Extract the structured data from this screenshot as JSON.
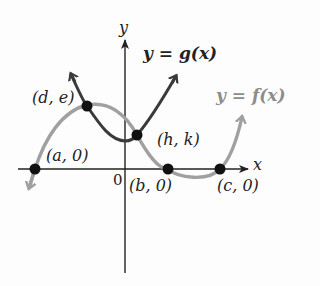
{
  "figure": {
    "x_axis_label": "x",
    "y_axis_label": "y",
    "origin_label": "0",
    "curve_g_label": "y = g(x)",
    "curve_f_label": "y = f(x)",
    "points": {
      "a": "(a, 0)",
      "b": "(b, 0)",
      "c": "(c, 0)",
      "de": "(d, e)",
      "hk": "(h, k)"
    },
    "colors": {
      "axes": "#222222",
      "g_curve": "#3a3a3a",
      "f_curve": "#a0a0a0",
      "points": "#111111",
      "background": "#fdfdfd"
    }
  }
}
